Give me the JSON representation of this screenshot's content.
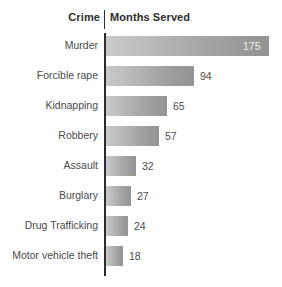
{
  "header": {
    "category_title": "Crime",
    "value_title": "Months Served"
  },
  "chart_data": {
    "type": "bar",
    "orientation": "horizontal",
    "title": "",
    "subtitle": "",
    "xlabel": "Months Served",
    "ylabel": "Crime",
    "categories": [
      "Murder",
      "Forcible rape",
      "Kidnapping",
      "Robbery",
      "Assault",
      "Burglary",
      "Drug Trafficking",
      "Motor vehicle theft"
    ],
    "values": [
      175,
      94,
      65,
      57,
      32,
      27,
      24,
      18
    ],
    "value_labels": [
      "175",
      "94",
      "65",
      "57",
      "32",
      "27",
      "24",
      "18"
    ],
    "label_placement": [
      "inside",
      "outside",
      "outside",
      "outside",
      "outside",
      "outside",
      "outside",
      "outside"
    ],
    "xlim": [
      0,
      175
    ],
    "grid": false,
    "legend": false,
    "bar_fill_start": "#c9c9c9",
    "bar_fill_end": "#949494",
    "axis_color": "#2b2b2b",
    "label_color": "#4a4a4a",
    "inside_label_color": "#f2f2f2"
  }
}
